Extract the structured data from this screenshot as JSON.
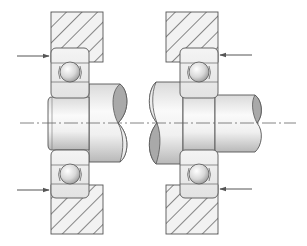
{
  "diagram": {
    "type": "bearing-arrangement-cross-section",
    "width": 307,
    "height": 246,
    "colors": {
      "background": "#ffffff",
      "outline": "#555555",
      "hatch": "#4a4a4a",
      "housing_fill": "#f2f2f2",
      "bearing_fill": "#ececec",
      "shaft_light": "#f7f7f7",
      "shaft_mid": "#dcdcdc",
      "shaft_dark": "#b5b5b5",
      "break_face": "#a9a9a9",
      "ball_light": "#ffffff",
      "ball_dark": "#9a9a9a",
      "arrow": "#555555",
      "centerline": "#666666"
    },
    "centerline": {
      "y": 123,
      "x1": 20,
      "x2": 296
    },
    "assemblies": [
      {
        "name": "left-assembly",
        "housing_top": {
          "x": 51,
          "y": 12,
          "w": 52,
          "h": 50
        },
        "housing_bottom": {
          "x": 51,
          "y": 185,
          "w": 52,
          "h": 49
        },
        "bearing_top": {
          "x": 51,
          "y": 48,
          "w": 38,
          "h": 50,
          "ball_cx": 70,
          "ball_cy": 72,
          "ball_r": 10
        },
        "bearing_bottom": {
          "x": 51,
          "y": 150,
          "w": 38,
          "h": 48,
          "ball_cx": 70,
          "ball_cy": 174,
          "ball_r": 10
        },
        "arrow_top": {
          "x1": 17,
          "x2": 49,
          "y": 56,
          "direction": "right"
        },
        "arrow_bottom": {
          "x1": 17,
          "x2": 49,
          "y": 190,
          "direction": "right"
        }
      },
      {
        "name": "right-assembly",
        "housing_top": {
          "x": 166,
          "y": 12,
          "w": 52,
          "h": 50
        },
        "housing_bottom": {
          "x": 166,
          "y": 185,
          "w": 52,
          "h": 49
        },
        "bearing_top": {
          "x": 180,
          "y": 48,
          "w": 38,
          "h": 50,
          "ball_cx": 199,
          "ball_cy": 72,
          "ball_r": 10
        },
        "bearing_bottom": {
          "x": 180,
          "y": 150,
          "w": 38,
          "h": 48,
          "ball_cx": 199,
          "ball_cy": 174,
          "ball_r": 10
        },
        "arrow_top": {
          "x1": 252,
          "x2": 220,
          "y": 55,
          "direction": "left"
        },
        "arrow_bottom": {
          "x1": 252,
          "x2": 220,
          "y": 189,
          "direction": "left"
        }
      }
    ],
    "labels": []
  }
}
